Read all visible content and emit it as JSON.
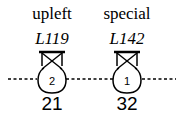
{
  "diagram": {
    "nodes": [
      {
        "name": "upleft",
        "code": "L119",
        "badge": "2",
        "value": "21",
        "cx": 52
      },
      {
        "name": "special",
        "code": "L142",
        "badge": "1",
        "value": "32",
        "cx": 127
      }
    ],
    "line_style": "dashed",
    "colors": {
      "stroke": "#000000",
      "background": "#ffffff"
    }
  }
}
